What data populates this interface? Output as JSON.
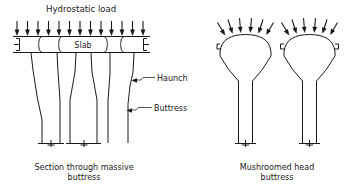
{
  "figure": {
    "title": "Hydrostatic load",
    "slab_label": "Slab",
    "callouts": {
      "haunch": "Haunch",
      "buttress": "Buttress"
    },
    "captions": {
      "left_line1": "Section through massive",
      "left_line2": "buttress",
      "right_line1": "Mushroomed head",
      "right_line2": "buttress"
    }
  },
  "colors": {
    "ink": "#1a1a1a",
    "paper": "#ffffff"
  },
  "left_diagram": {
    "name": "section-through-massive-buttress",
    "load_arrow_count": 13,
    "buttress_count": 3,
    "slab_present": true
  },
  "right_diagram": {
    "name": "mushroomed-head-buttress",
    "load_arrow_count": 14,
    "head_count": 2,
    "column_count": 2
  }
}
